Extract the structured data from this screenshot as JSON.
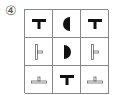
{
  "label": "④",
  "grid": {
    "rows": 3,
    "cols": 3,
    "cells": [
      {
        "row": 0,
        "col": 0,
        "shape": "t-bold"
      },
      {
        "row": 0,
        "col": 1,
        "shape": "half-circle-left-filled"
      },
      {
        "row": 0,
        "col": 2,
        "shape": "t-bold"
      },
      {
        "row": 1,
        "col": 0,
        "shape": "t-outline-rotated-right"
      },
      {
        "row": 1,
        "col": 1,
        "shape": "half-circle-right-filled"
      },
      {
        "row": 1,
        "col": 2,
        "shape": "t-outline-rotated-right"
      },
      {
        "row": 2,
        "col": 0,
        "shape": "inverted-t-outline"
      },
      {
        "row": 2,
        "col": 1,
        "shape": "t-bold"
      },
      {
        "row": 2,
        "col": 2,
        "shape": "inverted-t-outline"
      }
    ]
  }
}
